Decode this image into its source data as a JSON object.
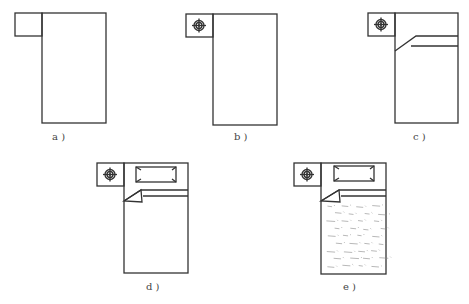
{
  "figure": {
    "panels": [
      {
        "id": "a",
        "label": "a )",
        "has_lamp": false,
        "has_quilt": false,
        "has_pillow": false,
        "has_pattern": false
      },
      {
        "id": "b",
        "label": "b )",
        "has_lamp": true,
        "has_quilt": false,
        "has_pillow": false,
        "has_pattern": false
      },
      {
        "id": "c",
        "label": "c )",
        "has_lamp": true,
        "has_quilt": true,
        "has_pillow": false,
        "has_pattern": false
      },
      {
        "id": "d",
        "label": "d )",
        "has_lamp": true,
        "has_quilt": true,
        "has_pillow": true,
        "has_pattern": false
      },
      {
        "id": "e",
        "label": "e )",
        "has_lamp": true,
        "has_quilt": true,
        "has_pillow": true,
        "has_pattern": true
      }
    ],
    "caption": "",
    "line_color": "#333333"
  }
}
